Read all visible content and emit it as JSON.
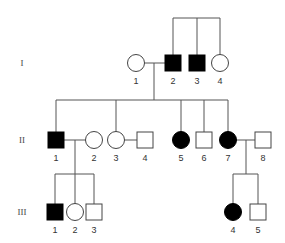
{
  "diagram": {
    "type": "pedigree",
    "colors": {
      "affected": "#000000",
      "unaffected": "#ffffff",
      "line": "#555555",
      "stroke": "#444444"
    },
    "generations": [
      {
        "label": "I",
        "y": 63
      },
      {
        "label": "II",
        "y": 140
      },
      {
        "label": "III",
        "y": 212
      }
    ],
    "individuals": [
      {
        "id": "I-1",
        "gen": 0,
        "number": "1",
        "sex": "female",
        "affected": false,
        "x": 136
      },
      {
        "id": "I-2",
        "gen": 0,
        "number": "2",
        "sex": "male",
        "affected": true,
        "x": 173
      },
      {
        "id": "I-3",
        "gen": 0,
        "number": "3",
        "sex": "male",
        "affected": true,
        "x": 197
      },
      {
        "id": "I-4",
        "gen": 0,
        "number": "4",
        "sex": "female",
        "affected": false,
        "x": 220
      },
      {
        "id": "II-1",
        "gen": 1,
        "number": "1",
        "sex": "male",
        "affected": true,
        "x": 56
      },
      {
        "id": "II-2",
        "gen": 1,
        "number": "2",
        "sex": "female",
        "affected": false,
        "x": 94
      },
      {
        "id": "II-3",
        "gen": 1,
        "number": "3",
        "sex": "female",
        "affected": false,
        "x": 116
      },
      {
        "id": "II-4",
        "gen": 1,
        "number": "4",
        "sex": "male",
        "affected": false,
        "x": 145
      },
      {
        "id": "II-5",
        "gen": 1,
        "number": "5",
        "sex": "female",
        "affected": true,
        "x": 181
      },
      {
        "id": "II-6",
        "gen": 1,
        "number": "6",
        "sex": "male",
        "affected": false,
        "x": 204
      },
      {
        "id": "II-7",
        "gen": 1,
        "number": "7",
        "sex": "female",
        "affected": true,
        "x": 228
      },
      {
        "id": "II-8",
        "gen": 1,
        "number": "8",
        "sex": "male",
        "affected": false,
        "x": 263
      },
      {
        "id": "III-1",
        "gen": 2,
        "number": "1",
        "sex": "male",
        "affected": true,
        "x": 55
      },
      {
        "id": "III-2",
        "gen": 2,
        "number": "2",
        "sex": "female",
        "affected": false,
        "x": 75
      },
      {
        "id": "III-3",
        "gen": 2,
        "number": "3",
        "sex": "male",
        "affected": false,
        "x": 94
      },
      {
        "id": "III-4",
        "gen": 2,
        "number": "4",
        "sex": "female",
        "affected": true,
        "x": 233
      },
      {
        "id": "III-5",
        "gen": 2,
        "number": "5",
        "sex": "male",
        "affected": false,
        "x": 258
      }
    ],
    "matings": [
      {
        "partners": [
          "I-1",
          "I-2"
        ]
      },
      {
        "partners": [
          "II-1",
          "II-2"
        ]
      },
      {
        "partners": [
          "II-3",
          "II-4"
        ]
      },
      {
        "partners": [
          "II-7",
          "II-8"
        ]
      }
    ],
    "sibships": [
      {
        "parents": "unknown",
        "children": [
          "I-2",
          "I-3",
          "I-4"
        ]
      },
      {
        "parents": [
          "I-1",
          "I-2"
        ],
        "children": [
          "II-1",
          "II-3",
          "II-5",
          "II-6",
          "II-7"
        ]
      },
      {
        "parents": [
          "II-1",
          "II-2"
        ],
        "children": [
          "III-1",
          "III-2",
          "III-3"
        ]
      },
      {
        "parents": [
          "II-7",
          "II-8"
        ],
        "children": [
          "III-4",
          "III-5"
        ]
      }
    ]
  }
}
